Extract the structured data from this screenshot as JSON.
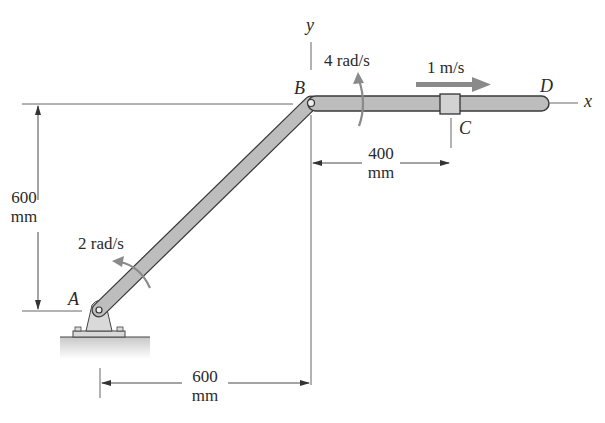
{
  "figure": {
    "points": {
      "A": "A",
      "B": "B",
      "C": "C",
      "D": "D"
    },
    "axes": {
      "x": "x",
      "y": "y"
    },
    "annotations": {
      "omega_AB": "2 rad/s",
      "omega_BD": "4 rad/s",
      "v_collar": "1 m/s"
    },
    "dimensions": {
      "vertical_AB": {
        "value": "600",
        "unit": "mm"
      },
      "horizontal_AB": {
        "value": "600",
        "unit": "mm"
      },
      "BC": {
        "value": "400",
        "unit": "mm"
      }
    },
    "colors": {
      "bar_fill": "#bdbdbd",
      "bar_stroke": "#3a3a3a",
      "arrow_gray": "#8a8a8a",
      "line": "#555555",
      "ground": "#cfcfcf"
    }
  }
}
